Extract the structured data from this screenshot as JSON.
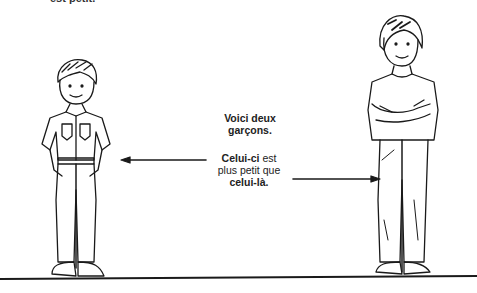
{
  "illustration": {
    "top_fragment": "est petit.",
    "caption_intro_line1": "Voici deux",
    "caption_intro_line2": "garçons.",
    "comparison": {
      "subject_bold": "Celui-ci",
      "text1": " est",
      "text2": "plus petit que",
      "object_bold": "celui-là."
    },
    "figures": [
      {
        "name": "smaller-boy",
        "description": "short boy with hands on hips, button shirt and trousers"
      },
      {
        "name": "taller-boy",
        "description": "tall boy with crossed arms, t-shirt and trousers"
      }
    ],
    "colors": {
      "ink": "#1a1a1a",
      "paper": "#ffffff"
    }
  }
}
